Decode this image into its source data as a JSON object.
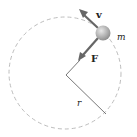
{
  "diagram": {
    "type": "circular-motion",
    "labels": {
      "velocity": "v",
      "force": "F",
      "mass": "m",
      "radius": "r"
    },
    "colors": {
      "path": "#b8b8b8",
      "arrow": "#555555",
      "radius_line": "#444444",
      "ball": "#a8a8a8"
    }
  }
}
